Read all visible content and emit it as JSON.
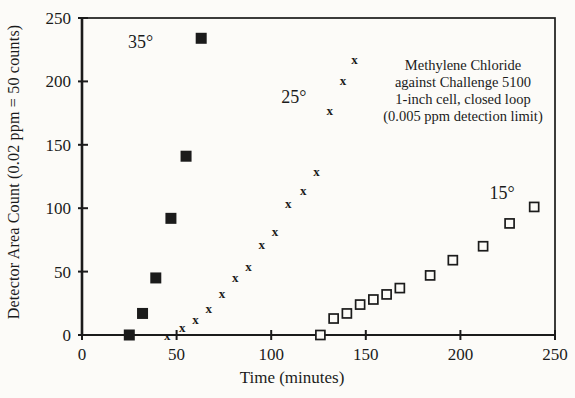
{
  "chart_data": {
    "type": "scatter",
    "title": "",
    "xlabel": "Time (minutes)",
    "ylabel": "Detector Area Count (0.02 ppm = 50 counts)",
    "xlim": [
      0,
      250
    ],
    "ylim": [
      0,
      250
    ],
    "xticks": [
      0,
      50,
      100,
      150,
      200,
      250
    ],
    "yticks": [
      0,
      50,
      100,
      150,
      200,
      250
    ],
    "grid": false,
    "legend": "inline-series-labels",
    "ink_color": "#1b1b1b",
    "background_color": "#fcfbf8",
    "annotation": {
      "lines": [
        "Methylene Chloride",
        "against Challenge 5100",
        "1-inch cell, closed loop",
        "(0.005 ppm detection limit)"
      ]
    },
    "series": [
      {
        "id": "35deg",
        "name": "35°",
        "label": "35°",
        "marker": "filled-square",
        "label_at": [
          31,
          226
        ],
        "points": [
          [
            25,
            0
          ],
          [
            32,
            17
          ],
          [
            39,
            45
          ],
          [
            47,
            92
          ],
          [
            55,
            141
          ],
          [
            63,
            234
          ]
        ]
      },
      {
        "id": "25deg",
        "name": "25°",
        "label": "25°",
        "marker": "x-serif",
        "label_at": [
          112,
          183
        ],
        "points": [
          [
            45,
            0
          ],
          [
            53,
            6
          ],
          [
            60,
            12
          ],
          [
            67,
            21
          ],
          [
            74,
            33
          ],
          [
            81,
            45
          ],
          [
            88,
            54
          ],
          [
            95,
            71
          ],
          [
            102,
            82
          ],
          [
            109,
            104
          ],
          [
            117,
            114
          ],
          [
            124,
            129
          ],
          [
            131,
            177
          ],
          [
            138,
            201
          ],
          [
            144,
            217
          ]
        ]
      },
      {
        "id": "15deg",
        "name": "15°",
        "label": "15°",
        "marker": "open-square",
        "label_at": [
          222,
          107
        ],
        "points": [
          [
            126,
            0
          ],
          [
            133,
            13
          ],
          [
            140,
            17
          ],
          [
            147,
            24
          ],
          [
            154,
            28
          ],
          [
            161,
            32
          ],
          [
            168,
            37
          ],
          [
            184,
            47
          ],
          [
            196,
            59
          ],
          [
            212,
            70
          ],
          [
            226,
            88
          ],
          [
            239,
            101
          ]
        ]
      }
    ]
  }
}
